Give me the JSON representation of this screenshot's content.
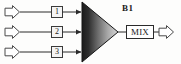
{
  "diagram": {
    "background_color": "#fdfdfc",
    "line_color": "#2b2b2b",
    "text_color": "#1a1a1a",
    "amplifier": {
      "label": "B1",
      "shape": "triangle",
      "fill_gradient_from": "#1d1d1d",
      "fill_gradient_to": "#cfcfcf",
      "label_x": 122,
      "label_y": 4
    },
    "mixer": {
      "label": "MIX",
      "shape": "rectangle",
      "x": 126,
      "y": 25,
      "width": 28,
      "height": 14
    },
    "inputs": [
      {
        "arrow_name": "input-arrow-1",
        "block_label": "1",
        "row_y": 12,
        "arrow_x": 6,
        "box_x": 51
      },
      {
        "arrow_name": "input-arrow-2",
        "block_label": "2",
        "row_y": 32,
        "arrow_x": 6,
        "box_x": 51
      },
      {
        "arrow_name": "input-arrow-3",
        "block_label": "3",
        "row_y": 52,
        "arrow_x": 6,
        "box_x": 51
      }
    ],
    "output": {
      "arrow_name": "output-arrow",
      "row_y": 32,
      "arrow_x": 160
    }
  }
}
